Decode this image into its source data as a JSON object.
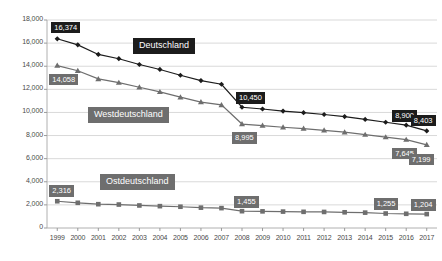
{
  "chart_data": {
    "type": "line",
    "title": "",
    "subtitle": "",
    "xlabel": "",
    "ylabel": "",
    "grid": true,
    "legend_position": "inline-annotations",
    "ylim": [
      0,
      18000
    ],
    "yticks": [
      "0",
      "2,000",
      "4,000",
      "6,000",
      "8,000",
      "10,000",
      "12,000",
      "14,000",
      "16,000",
      "18,000"
    ],
    "ytick_values": [
      0,
      2000,
      4000,
      6000,
      8000,
      10000,
      12000,
      14000,
      16000,
      18000
    ],
    "categories": [
      "1999",
      "2000",
      "2001",
      "2002",
      "2003",
      "2004",
      "2005",
      "2006",
      "2007",
      "2008",
      "2009",
      "2010",
      "2011",
      "2012",
      "2013",
      "2014",
      "2015",
      "2016",
      "2017"
    ],
    "series": [
      {
        "name": "Deutschland",
        "color": "#1c1c1c",
        "marker": "diamond",
        "values": [
          16374,
          15850,
          15020,
          14650,
          14150,
          13720,
          13220,
          12760,
          12440,
          10450,
          10300,
          10120,
          9980,
          9820,
          9640,
          9400,
          9150,
          8900,
          8403
        ]
      },
      {
        "name": "Westdeutschland",
        "color": "#6e6e6e",
        "marker": "triangle",
        "values": [
          14058,
          13610,
          12900,
          12580,
          12180,
          11780,
          11320,
          10900,
          10650,
          8995,
          8860,
          8720,
          8600,
          8450,
          8290,
          8080,
          7860,
          7645,
          7199
        ]
      },
      {
        "name": "Ostdeutschland",
        "color": "#6e6e6e",
        "marker": "square",
        "values": [
          2316,
          2180,
          2060,
          2030,
          1950,
          1890,
          1840,
          1760,
          1720,
          1455,
          1440,
          1420,
          1400,
          1390,
          1360,
          1330,
          1255,
          1230,
          1204
        ]
      }
    ],
    "data_labels": [
      {
        "text": "16,374",
        "series": "Deutschland",
        "category": "1999",
        "style": "dark"
      },
      {
        "text": "10,450",
        "series": "Deutschland",
        "category": "2008",
        "style": "dark"
      },
      {
        "text": "8,900",
        "series": "Deutschland",
        "category": "2016",
        "style": "dark"
      },
      {
        "text": "8,403",
        "series": "Deutschland",
        "category": "2017",
        "style": "dark"
      },
      {
        "text": "14,058",
        "series": "Westdeutschland",
        "category": "1999",
        "style": "mid"
      },
      {
        "text": "8,995",
        "series": "Westdeutschland",
        "category": "2008",
        "style": "mid"
      },
      {
        "text": "7,645",
        "series": "Westdeutschland",
        "category": "2016",
        "style": "mid"
      },
      {
        "text": "7,199",
        "series": "Westdeutschland",
        "category": "2017",
        "style": "mid"
      },
      {
        "text": "2,316",
        "series": "Ostdeutschland",
        "category": "1999",
        "style": "mid"
      },
      {
        "text": "1,455",
        "series": "Ostdeutschland",
        "category": "2008",
        "style": "mid"
      },
      {
        "text": "1,255",
        "series": "Ostdeutschland",
        "category": "2015",
        "style": "mid"
      },
      {
        "text": "1,204",
        "series": "Ostdeutschland",
        "category": "2017",
        "style": "mid"
      }
    ],
    "series_annotations": [
      {
        "text": "Deutschland",
        "style": "dark"
      },
      {
        "text": "Westdeutschland",
        "style": "mid"
      },
      {
        "text": "Ostdeutschland",
        "style": "mid"
      }
    ]
  },
  "colors": {
    "deutschland": "#1c1c1c",
    "westdeutschland": "#6e6e6e",
    "ostdeutschland": "#6e6e6e",
    "grid": "#d9d9d9",
    "axis_text": "#4a4a4a",
    "background": "#ffffff"
  }
}
